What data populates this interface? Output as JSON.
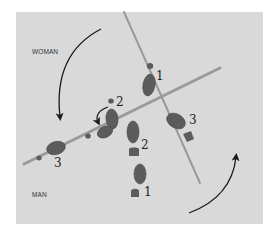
{
  "diagram": {
    "type": "dance-footwork",
    "labels": {
      "woman": "WOMAN",
      "man": "MAN"
    },
    "colors": {
      "background": "#d9d9d9",
      "footprint": "#5c5c5c",
      "line": "#9a9a9a",
      "arrow": "#1a1a1a"
    },
    "woman_steps": [
      {
        "step": "1",
        "text": "1"
      },
      {
        "step": "2",
        "text": "2"
      },
      {
        "step": "3",
        "text": "3"
      }
    ],
    "man_steps": [
      {
        "step": "1",
        "text": "1"
      },
      {
        "step": "2",
        "text": "2"
      },
      {
        "step": "3",
        "text": "3"
      }
    ],
    "rotation_arrows": [
      "counter-clockwise upper-left",
      "counter-clockwise lower-right",
      "small turn at step 2"
    ]
  }
}
